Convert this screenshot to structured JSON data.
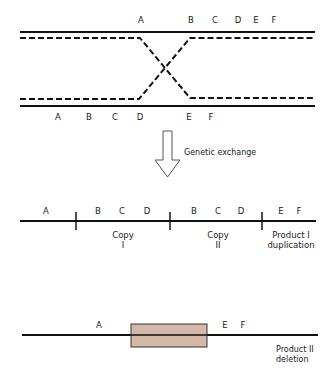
{
  "top_panel": {
    "strand1_labels": [
      {
        "text": "A",
        "x": 141,
        "y": 15
      },
      {
        "text": "B",
        "x": 191,
        "y": 15
      },
      {
        "text": "C",
        "x": 215,
        "y": 15
      },
      {
        "text": "D",
        "x": 238,
        "y": 15
      },
      {
        "text": "E",
        "x": 256,
        "y": 15
      },
      {
        "text": "F",
        "x": 274,
        "y": 15
      }
    ],
    "strand2_labels": [
      {
        "text": "A",
        "x": 58,
        "y": 112
      },
      {
        "text": "B",
        "x": 89,
        "y": 112
      },
      {
        "text": "C",
        "x": 115,
        "y": 112
      },
      {
        "text": "D",
        "x": 140,
        "y": 112
      },
      {
        "text": "E",
        "x": 189,
        "y": 112
      },
      {
        "text": "F",
        "x": 211,
        "y": 112
      }
    ]
  },
  "arrow": {
    "label": "Genetic exchange"
  },
  "product1": {
    "labels": [
      {
        "text": "A",
        "x": 46,
        "y": 206
      },
      {
        "text": "B",
        "x": 98,
        "y": 206
      },
      {
        "text": "C",
        "x": 122,
        "y": 206
      },
      {
        "text": "D",
        "x": 147,
        "y": 206
      },
      {
        "text": "B",
        "x": 194,
        "y": 206
      },
      {
        "text": "C",
        "x": 218,
        "y": 206
      },
      {
        "text": "D",
        "x": 241,
        "y": 206
      },
      {
        "text": "E",
        "x": 281,
        "y": 206
      },
      {
        "text": "F",
        "x": 299,
        "y": 206
      }
    ],
    "copy1": {
      "line1": "Copy",
      "line2": "I"
    },
    "copy2": {
      "line1": "Copy",
      "line2": "II"
    },
    "name": {
      "line1": "Product I",
      "line2": "duplication"
    }
  },
  "product2": {
    "labels": [
      {
        "text": "A",
        "x": 99,
        "y": 320
      },
      {
        "text": "E",
        "x": 225,
        "y": 320
      },
      {
        "text": "F",
        "x": 243,
        "y": 320
      }
    ],
    "name": {
      "line1": "Product II",
      "line2": "deletion"
    },
    "box_color": "#d4b8a8"
  }
}
